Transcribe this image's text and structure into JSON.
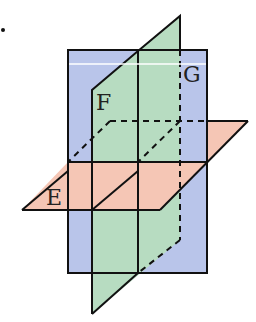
{
  "diagram": {
    "planes": [
      {
        "id": "G",
        "label": "G",
        "color": "#b9c5ea",
        "orientation": "vertical-front"
      },
      {
        "id": "F",
        "label": "F",
        "color": "#b7dcc1",
        "orientation": "vertical-oblique"
      },
      {
        "id": "E",
        "label": "E",
        "color": "#f5c6b5",
        "orientation": "horizontal"
      }
    ],
    "colors": {
      "stroke": "#111111",
      "highlight_line": "#ffffff"
    }
  }
}
